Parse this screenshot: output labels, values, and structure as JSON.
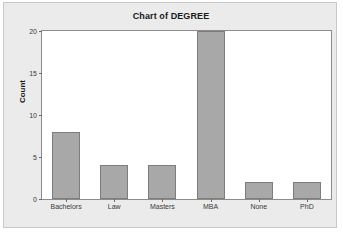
{
  "chart_data": {
    "type": "bar",
    "title": "Chart of DEGREE",
    "xlabel": "DEGREE",
    "ylabel": "Count",
    "categories": [
      "Bachelors",
      "Law",
      "Masters",
      "MBA",
      "None",
      "PhD"
    ],
    "values": [
      8,
      4,
      4,
      20,
      2,
      2
    ],
    "ylim": [
      0,
      20
    ],
    "yticks": [
      0,
      5,
      10,
      15,
      20
    ],
    "ytick_labels": [
      "0",
      "5",
      "10",
      "15",
      "20"
    ],
    "grid": false,
    "legend": null,
    "bar_color": "#a8a8a8",
    "bar_edge_color": "#7d7d7d",
    "plot_background": "#ffffff",
    "panel_background": "#ebebeb"
  }
}
